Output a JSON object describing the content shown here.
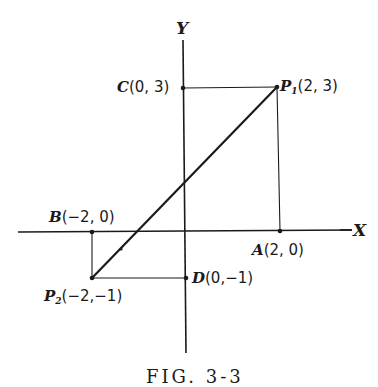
{
  "figure": {
    "caption": "FIG. 3-3",
    "axes": {
      "x_label": "X",
      "y_label": "Y"
    },
    "points": [
      {
        "id": "P1",
        "letter": "P",
        "sub": "1",
        "coord": "(2, 3)",
        "x": 2,
        "y": 3
      },
      {
        "id": "P2",
        "letter": "P",
        "sub": "2",
        "coord": "(−2,−1)",
        "x": -2,
        "y": -1
      },
      {
        "id": "A",
        "letter": "A",
        "sub": "",
        "coord": "(2, 0)",
        "x": 2,
        "y": 0
      },
      {
        "id": "B",
        "letter": "B",
        "sub": "",
        "coord": "(−2, 0)",
        "x": -2,
        "y": 0
      },
      {
        "id": "C",
        "letter": "C",
        "sub": "",
        "coord": "(0, 3)",
        "x": 0,
        "y": 3
      },
      {
        "id": "D",
        "letter": "D",
        "sub": "",
        "coord": "(0,−1)",
        "x": 0,
        "y": -1
      }
    ],
    "segments": [
      {
        "from": "P2",
        "to": "P1",
        "style": "bold"
      },
      {
        "from": "C",
        "to": "P1",
        "style": "thin"
      },
      {
        "from": "P1",
        "to": "A",
        "style": "thin"
      },
      {
        "from": "B",
        "to": "P2",
        "style": "thin"
      },
      {
        "from": "P2",
        "to": "D",
        "style": "thin"
      }
    ],
    "line_color": "#1a1a1a"
  }
}
